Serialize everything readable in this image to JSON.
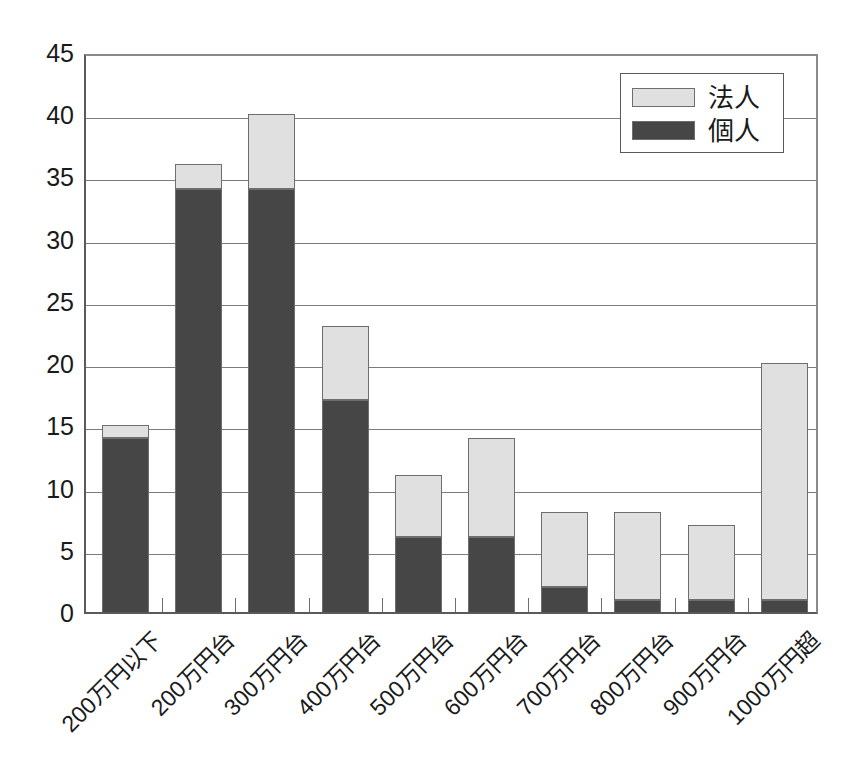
{
  "chart_data": {
    "type": "bar",
    "subtype": "stacked-vertical",
    "title": "",
    "subtitle": "",
    "xlabel": "",
    "ylabel": "",
    "ylim": [
      0,
      45
    ],
    "ytick_step": 5,
    "ytick_labels": [
      "45",
      "40",
      "35",
      "30",
      "25",
      "20",
      "15",
      "10",
      "5",
      "0"
    ],
    "ytick_values": [
      45,
      40,
      35,
      30,
      25,
      20,
      15,
      10,
      5,
      0
    ],
    "grid": true,
    "grid_axis": "y",
    "legend_position": "top-right",
    "categories": [
      "200万円以下",
      "200万円台",
      "300万円台",
      "400万円台",
      "500万円台",
      "600万円台",
      "700万円台",
      "800万円台",
      "900万円台",
      "1000万円超"
    ],
    "series": [
      {
        "name": "個人",
        "color": "#464646",
        "values": [
          14,
          34,
          34,
          17,
          6,
          6,
          2,
          1,
          1,
          1
        ]
      },
      {
        "name": "法人",
        "color": "#e0e0e0",
        "values": [
          1,
          2,
          6,
          6,
          5,
          8,
          6,
          7,
          6,
          19
        ]
      }
    ],
    "totals": [
      15,
      36,
      40,
      23,
      11,
      14,
      8,
      8,
      7,
      20
    ],
    "stack_order": [
      "個人",
      "法人"
    ],
    "annotations": []
  },
  "legend": {
    "items": [
      {
        "label": "法人",
        "color": "#e0e0e0"
      },
      {
        "label": "個人",
        "color": "#464646"
      }
    ]
  },
  "colors": {
    "corporate": "#e0e0e0",
    "individual": "#464646",
    "axis": "#5a5a5a",
    "grid": "#7c7c7c",
    "bar_outline": "#6e6e6e",
    "background": "#ffffff",
    "text": "#1a1a1a"
  }
}
